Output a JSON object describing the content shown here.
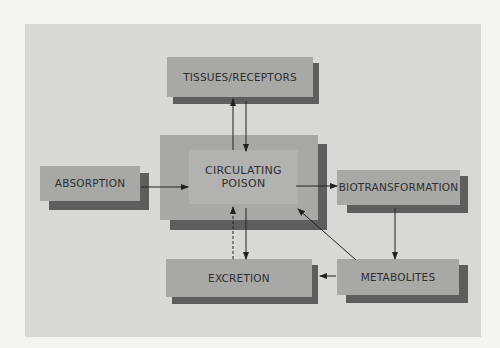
{
  "diagram": {
    "title": "",
    "nodes": {
      "tissues": {
        "label": "TISSUES/RECEPTORS"
      },
      "circulating": {
        "line1": "CIRCULATING",
        "line2": "POISON"
      },
      "absorption": {
        "label": "ABSORPTION"
      },
      "biotransformation": {
        "label": "BIOTRANSFORMATION"
      },
      "excretion": {
        "label": "EXCRETION"
      },
      "metabolites": {
        "label": "METABOLITES"
      }
    },
    "edges": [
      {
        "from": "ABSORPTION",
        "to": "CIRCULATING POISON",
        "style": "solid"
      },
      {
        "from": "CIRCULATING POISON",
        "to": "TISSUES/RECEPTORS",
        "style": "solid"
      },
      {
        "from": "TISSUES/RECEPTORS",
        "to": "CIRCULATING POISON",
        "style": "solid"
      },
      {
        "from": "CIRCULATING POISON",
        "to": "BIOTRANSFORMATION",
        "style": "solid"
      },
      {
        "from": "BIOTRANSFORMATION",
        "to": "METABOLITES",
        "style": "solid"
      },
      {
        "from": "METABOLITES",
        "to": "EXCRETION",
        "style": "solid"
      },
      {
        "from": "METABOLITES",
        "to": "CIRCULATING POISON",
        "style": "solid"
      },
      {
        "from": "CIRCULATING POISON",
        "to": "EXCRETION",
        "style": "solid"
      },
      {
        "from": "EXCRETION",
        "to": "CIRCULATING POISON",
        "style": "dashed"
      }
    ],
    "colors": {
      "panel": "#d8d8d6",
      "box": "#a8a8a6",
      "inner_box": "#b2b2b0",
      "shadow": "#5e5e5e",
      "text": "#2f2f2f",
      "arrow": "#222222"
    }
  }
}
